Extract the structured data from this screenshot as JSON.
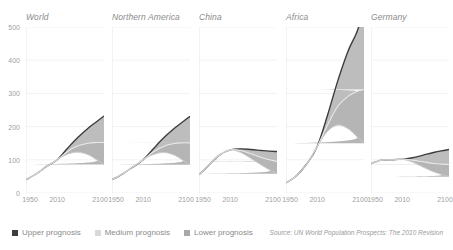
{
  "chart_data": {
    "type": "area",
    "title": "",
    "subtitle": "",
    "xlabel": "",
    "ylabel": "",
    "xlim": [
      1950,
      2100
    ],
    "ylim": [
      0,
      500
    ],
    "xticks": [
      1950,
      2010,
      2100
    ],
    "yticks": [
      0,
      100,
      200,
      300,
      400,
      500
    ],
    "grid": true,
    "legend_position": "bottom-left",
    "note": "Small multiples: indexed population projections (1950=index) per region, with upper / medium / lower UN prognosis bands.",
    "series_names": [
      "Upper prognosis",
      "Medium prognosis",
      "Lower prognosis"
    ],
    "series_colors": [
      "#3d3d3d",
      "#d8d8d8",
      "#a8a8a8"
    ],
    "panels": [
      {
        "title": "World",
        "x": [
          1950,
          1970,
          1990,
          2010,
          2030,
          2050,
          2070,
          2085,
          2100
        ],
        "upper": [
          40,
          58,
          80,
          100,
          135,
          168,
          196,
          214,
          232
        ],
        "medium": [
          40,
          58,
          80,
          100,
          125,
          142,
          150,
          152,
          152
        ],
        "lower": [
          40,
          58,
          80,
          100,
          117,
          123,
          115,
          101,
          86
        ]
      },
      {
        "title": "Northern America",
        "x": [
          1950,
          1970,
          1990,
          2010,
          2030,
          2050,
          2070,
          2085,
          2100
        ],
        "upper": [
          40,
          57,
          78,
          100,
          134,
          167,
          195,
          213,
          231
        ],
        "medium": [
          40,
          57,
          78,
          100,
          124,
          141,
          149,
          151,
          151
        ],
        "lower": [
          40,
          57,
          78,
          100,
          116,
          122,
          114,
          100,
          85
        ]
      },
      {
        "title": "China",
        "x": [
          1950,
          1970,
          1990,
          2010,
          2030,
          2050,
          2070,
          2085,
          2100
        ],
        "upper": [
          55,
          85,
          115,
          130,
          133,
          131,
          128,
          126,
          125
        ],
        "medium": [
          55,
          85,
          115,
          130,
          128,
          118,
          107,
          100,
          95
        ],
        "lower": [
          55,
          85,
          115,
          130,
          122,
          104,
          84,
          70,
          58
        ]
      },
      {
        "title": "Africa",
        "x": [
          1950,
          1970,
          1990,
          2010,
          2030,
          2050,
          2070,
          2085,
          2100
        ],
        "upper": [
          30,
          52,
          88,
          140,
          235,
          340,
          430,
          480,
          545
        ],
        "medium": [
          30,
          52,
          88,
          140,
          205,
          262,
          292,
          305,
          312
        ],
        "lower": [
          30,
          52,
          88,
          140,
          186,
          205,
          193,
          172,
          150
        ]
      },
      {
        "title": "Germany",
        "x": [
          1950,
          1970,
          1990,
          2010,
          2030,
          2050,
          2070,
          2085,
          2100
        ],
        "upper": [
          88,
          99,
          100,
          102,
          106,
          114,
          122,
          127,
          131
        ],
        "medium": [
          88,
          99,
          100,
          102,
          99,
          94,
          89,
          87,
          86
        ],
        "lower": [
          88,
          99,
          100,
          102,
          93,
          78,
          64,
          56,
          49
        ]
      }
    ]
  },
  "yaxis": {
    "labels": [
      "500",
      "400",
      "300",
      "200",
      "100",
      "0"
    ]
  },
  "xaxis": {
    "labels": [
      "1950",
      "2010",
      "2100"
    ]
  },
  "panel_titles": {
    "world": "World",
    "northern_america": "Northern America",
    "china": "China",
    "africa": "Africa",
    "germany": "Germany"
  },
  "legend": {
    "upper": "Upper prognosis",
    "medium": "Medium prognosis",
    "lower": "Lower prognosis"
  },
  "source": {
    "text": "Source: UN World Population Prospects: The 2010 Revision"
  }
}
